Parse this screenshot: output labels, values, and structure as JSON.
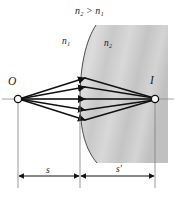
{
  "figure": {
    "type": "optics-refraction-spherical-surface",
    "labels": {
      "condition": "n₂ > n₁",
      "medium_left": "n₁",
      "medium_right": "n₂",
      "object_point": "O",
      "image_point": "I",
      "object_distance": "s",
      "image_distance": "s′"
    },
    "colors": {
      "medium_fill_light": "#d9d9d9",
      "medium_fill_dark": "#b3b3b3",
      "stroke": "#1a1a1a",
      "thin_line": "#808080",
      "background": "#ffffff",
      "point_fill": "#ffffff"
    },
    "geometry": {
      "axis_y": 99,
      "object_x": 18,
      "vertex_x": 80,
      "image_x": 155,
      "medium_right_x": 168,
      "dimension_row_y": 176,
      "ray_count": 5
    }
  }
}
